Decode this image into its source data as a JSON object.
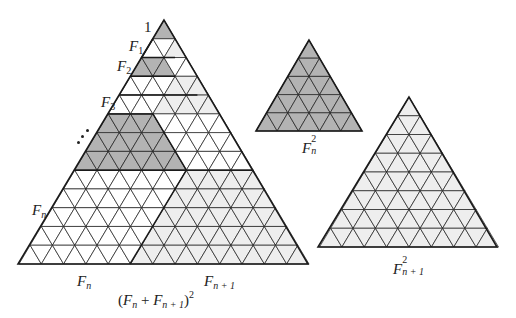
{
  "figure": {
    "colors": {
      "dark": "#b3b3b3",
      "light": "#eeeeee",
      "white": "#ffffff",
      "stroke": "#1a1a1a"
    },
    "big_triangle": {
      "rows": 13,
      "apex": [
        164,
        20
      ],
      "base_y": 264,
      "base_left": 18,
      "base_right": 308,
      "fills": [
        {
          "row": 1,
          "color": "dark",
          "from": 0,
          "to": 0
        },
        {
          "row": 2,
          "color": "light",
          "from": 2,
          "to": 2
        },
        {
          "row": 3,
          "color": "dark",
          "from": 0,
          "to": 2
        },
        {
          "row": 4,
          "color": "light",
          "from": 4,
          "to": 6
        },
        {
          "row": 5,
          "color": "light",
          "from": 4,
          "to": 8
        },
        {
          "row": 6,
          "color": "dark",
          "from": 0,
          "to": 4
        },
        {
          "row": 7,
          "color": "dark",
          "from": 0,
          "to": 6
        },
        {
          "row": 8,
          "color": "dark",
          "from": 0,
          "to": 8
        },
        {
          "row": 9,
          "color": "light",
          "from": 10,
          "to": 16
        },
        {
          "row": 10,
          "color": "light",
          "from": 10,
          "to": 18
        },
        {
          "row": 11,
          "color": "light",
          "from": 10,
          "to": 20
        },
        {
          "row": 12,
          "color": "light",
          "from": 10,
          "to": 22
        },
        {
          "row": 13,
          "color": "light",
          "from": 10,
          "to": 24
        }
      ],
      "heavy_lines": [
        [
          [
            152.9,
            38.8
          ],
          [
            141.7,
            57.5
          ],
          [
            175.1,
            57.5
          ]
        ],
        [
          [
            130.6,
            76.3
          ],
          [
            175.1,
            76.3
          ]
        ],
        [
          [
            119.5,
            95.1
          ],
          [
            197.4,
            95.1
          ]
        ],
        [
          [
            108.4,
            113.9
          ],
          [
            153.0,
            113.9
          ],
          [
            186.4,
            170.2
          ]
        ],
        [
          [
            73.9,
            170.2
          ],
          [
            253.1,
            170.2
          ]
        ],
        [
          [
            130,
            264
          ],
          [
            186.4,
            170.2
          ]
        ]
      ]
    },
    "small_dark_triangle": {
      "rows": 5,
      "apex": [
        309,
        40
      ],
      "base_y": 131,
      "base_left": 256,
      "base_right": 362,
      "color": "dark"
    },
    "light_triangle": {
      "rows": 8,
      "apex": [
        409,
        97
      ],
      "base_y": 247,
      "base_left": 318,
      "base_right": 497,
      "color": "light"
    },
    "labels": {
      "one": "1",
      "f1": {
        "base": "F",
        "sub": "1"
      },
      "f2": {
        "base": "F",
        "sub": "2"
      },
      "f3": {
        "base": "F",
        "sub": "3"
      },
      "fn_left": {
        "base": "F",
        "sub": "n"
      },
      "fn_bottom": {
        "base": "F",
        "sub": "n"
      },
      "fn1_bottom": {
        "base": "F",
        "sub": "n + 1"
      },
      "sum_sq": {
        "open": "(",
        "a": "F",
        "a_sub": "n",
        "plus": " + ",
        "b": "F",
        "b_sub": "n + 1",
        "close": ")",
        "exp": "2"
      },
      "fn_sq": {
        "base": "F",
        "sup": "2",
        "sub": "n"
      },
      "fn1_sq": {
        "base": "F",
        "sup": "2",
        "sub": "n + 1"
      }
    }
  }
}
